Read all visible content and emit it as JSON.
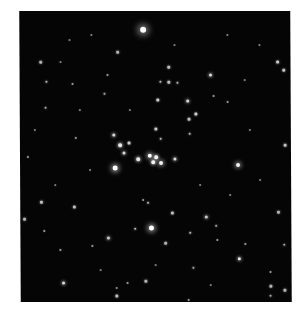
{
  "image": {
    "subject": "Open star cluster in a dense star field",
    "background_color": "#050505",
    "page_background": "#ffffff",
    "frame": {
      "left": 20,
      "top": 11,
      "width": 271,
      "height": 291
    }
  },
  "stars": [
    {
      "x": 144,
      "y": 30,
      "r": 3.2,
      "glow": 7,
      "b": 1.0
    },
    {
      "x": 115,
      "y": 168,
      "r": 2.4,
      "glow": 5,
      "b": 1.0
    },
    {
      "x": 151,
      "y": 228,
      "r": 2.4,
      "glow": 5,
      "b": 1.0
    },
    {
      "x": 238,
      "y": 165,
      "r": 2.0,
      "glow": 4,
      "b": 0.95
    },
    {
      "x": 150,
      "y": 156,
      "r": 2.2,
      "glow": 4,
      "b": 1.0
    },
    {
      "x": 156,
      "y": 157,
      "r": 1.8,
      "glow": 3,
      "b": 0.95
    },
    {
      "x": 153,
      "y": 162,
      "r": 1.8,
      "glow": 3,
      "b": 0.95
    },
    {
      "x": 161,
      "y": 163,
      "r": 2.0,
      "glow": 4,
      "b": 0.95
    },
    {
      "x": 138,
      "y": 159,
      "r": 1.8,
      "glow": 3,
      "b": 0.9
    },
    {
      "x": 175,
      "y": 159,
      "r": 1.6,
      "glow": 3,
      "b": 0.85
    },
    {
      "x": 120,
      "y": 145,
      "r": 1.8,
      "glow": 3,
      "b": 0.9
    },
    {
      "x": 129,
      "y": 143,
      "r": 1.4,
      "glow": 2,
      "b": 0.8
    },
    {
      "x": 124,
      "y": 153,
      "r": 1.5,
      "glow": 3,
      "b": 0.85
    },
    {
      "x": 114,
      "y": 135,
      "r": 1.6,
      "glow": 3,
      "b": 0.85
    },
    {
      "x": 156,
      "y": 129,
      "r": 1.5,
      "glow": 2,
      "b": 0.8
    },
    {
      "x": 161,
      "y": 139,
      "r": 1.2,
      "glow": 2,
      "b": 0.7
    },
    {
      "x": 158,
      "y": 100,
      "r": 1.4,
      "glow": 2,
      "b": 0.8
    },
    {
      "x": 188,
      "y": 101,
      "r": 1.5,
      "glow": 3,
      "b": 0.85
    },
    {
      "x": 196,
      "y": 114,
      "r": 1.4,
      "glow": 2,
      "b": 0.8
    },
    {
      "x": 189,
      "y": 119,
      "r": 1.3,
      "glow": 2,
      "b": 0.75
    },
    {
      "x": 190,
      "y": 134,
      "r": 1.2,
      "glow": 2,
      "b": 0.7
    },
    {
      "x": 211,
      "y": 75,
      "r": 1.6,
      "glow": 3,
      "b": 0.85
    },
    {
      "x": 169,
      "y": 67,
      "r": 1.3,
      "glow": 2,
      "b": 0.75
    },
    {
      "x": 161,
      "y": 82,
      "r": 1.2,
      "glow": 2,
      "b": 0.7
    },
    {
      "x": 169,
      "y": 82,
      "r": 1.3,
      "glow": 2,
      "b": 0.75
    },
    {
      "x": 178,
      "y": 83,
      "r": 1.2,
      "glow": 2,
      "b": 0.7
    },
    {
      "x": 278,
      "y": 62,
      "r": 1.4,
      "glow": 2,
      "b": 0.8
    },
    {
      "x": 284,
      "y": 70,
      "r": 1.3,
      "glow": 2,
      "b": 0.75
    },
    {
      "x": 285,
      "y": 145,
      "r": 1.3,
      "glow": 2,
      "b": 0.75
    },
    {
      "x": 214,
      "y": 96,
      "r": 1.1,
      "glow": 1,
      "b": 0.6
    },
    {
      "x": 228,
      "y": 102,
      "r": 1.1,
      "glow": 1,
      "b": 0.6
    },
    {
      "x": 41,
      "y": 62,
      "r": 1.3,
      "glow": 2,
      "b": 0.7
    },
    {
      "x": 47,
      "y": 82,
      "r": 1.2,
      "glow": 2,
      "b": 0.7
    },
    {
      "x": 73,
      "y": 84,
      "r": 1.1,
      "glow": 1,
      "b": 0.6
    },
    {
      "x": 46,
      "y": 108,
      "r": 1.2,
      "glow": 2,
      "b": 0.65
    },
    {
      "x": 118,
      "y": 52,
      "r": 1.3,
      "glow": 2,
      "b": 0.7
    },
    {
      "x": 108,
      "y": 75,
      "r": 1.1,
      "glow": 1,
      "b": 0.6
    },
    {
      "x": 105,
      "y": 94,
      "r": 1.2,
      "glow": 2,
      "b": 0.65
    },
    {
      "x": 28,
      "y": 157,
      "r": 1.1,
      "glow": 1,
      "b": 0.6
    },
    {
      "x": 76,
      "y": 138,
      "r": 1.1,
      "glow": 1,
      "b": 0.6
    },
    {
      "x": 41,
      "y": 202,
      "r": 1.3,
      "glow": 2,
      "b": 0.75
    },
    {
      "x": 74,
      "y": 207,
      "r": 1.4,
      "glow": 2,
      "b": 0.75
    },
    {
      "x": 24,
      "y": 219,
      "r": 1.3,
      "glow": 2,
      "b": 0.7
    },
    {
      "x": 108,
      "y": 238,
      "r": 1.5,
      "glow": 3,
      "b": 0.8
    },
    {
      "x": 44,
      "y": 231,
      "r": 1.1,
      "glow": 1,
      "b": 0.6
    },
    {
      "x": 63,
      "y": 283,
      "r": 1.6,
      "glow": 3,
      "b": 0.85
    },
    {
      "x": 116,
      "y": 296,
      "r": 1.4,
      "glow": 2,
      "b": 0.75
    },
    {
      "x": 60,
      "y": 250,
      "r": 1.1,
      "glow": 1,
      "b": 0.6
    },
    {
      "x": 92,
      "y": 246,
      "r": 1.1,
      "glow": 1,
      "b": 0.6
    },
    {
      "x": 127,
      "y": 283,
      "r": 1.1,
      "glow": 1,
      "b": 0.6
    },
    {
      "x": 172,
      "y": 213,
      "r": 1.4,
      "glow": 2,
      "b": 0.75
    },
    {
      "x": 206,
      "y": 217,
      "r": 1.5,
      "glow": 3,
      "b": 0.8
    },
    {
      "x": 135,
      "y": 229,
      "r": 1.2,
      "glow": 2,
      "b": 0.7
    },
    {
      "x": 190,
      "y": 233,
      "r": 1.2,
      "glow": 2,
      "b": 0.7
    },
    {
      "x": 148,
      "y": 203,
      "r": 1.2,
      "glow": 2,
      "b": 0.7
    },
    {
      "x": 143,
      "y": 200,
      "r": 1.1,
      "glow": 1,
      "b": 0.6
    },
    {
      "x": 216,
      "y": 226,
      "r": 1.2,
      "glow": 2,
      "b": 0.65
    },
    {
      "x": 239,
      "y": 259,
      "r": 1.7,
      "glow": 3,
      "b": 0.9
    },
    {
      "x": 165,
      "y": 243,
      "r": 1.3,
      "glow": 2,
      "b": 0.7
    },
    {
      "x": 145,
      "y": 281,
      "r": 1.3,
      "glow": 2,
      "b": 0.7
    },
    {
      "x": 193,
      "y": 268,
      "r": 1.2,
      "glow": 2,
      "b": 0.65
    },
    {
      "x": 270,
      "y": 286,
      "r": 1.3,
      "glow": 2,
      "b": 0.7
    },
    {
      "x": 284,
      "y": 290,
      "r": 1.3,
      "glow": 2,
      "b": 0.7
    },
    {
      "x": 270,
      "y": 296,
      "r": 1.2,
      "glow": 2,
      "b": 0.65
    },
    {
      "x": 217,
      "y": 240,
      "r": 1.1,
      "glow": 1,
      "b": 0.6
    },
    {
      "x": 245,
      "y": 244,
      "r": 1.1,
      "glow": 1,
      "b": 0.6
    },
    {
      "x": 270,
      "y": 272,
      "r": 1.1,
      "glow": 1,
      "b": 0.6
    },
    {
      "x": 188,
      "y": 300,
      "r": 1.1,
      "glow": 1,
      "b": 0.6
    },
    {
      "x": 278,
      "y": 212,
      "r": 1.3,
      "glow": 2,
      "b": 0.7
    },
    {
      "x": 284,
      "y": 245,
      "r": 1.2,
      "glow": 2,
      "b": 0.65
    },
    {
      "x": 116,
      "y": 288,
      "r": 1.0,
      "glow": 1,
      "b": 0.55
    },
    {
      "x": 61,
      "y": 62,
      "r": 1.0,
      "glow": 1,
      "b": 0.5
    },
    {
      "x": 92,
      "y": 35,
      "r": 1.0,
      "glow": 1,
      "b": 0.5
    },
    {
      "x": 228,
      "y": 35,
      "r": 1.0,
      "glow": 1,
      "b": 0.5
    },
    {
      "x": 260,
      "y": 45,
      "r": 1.0,
      "glow": 1,
      "b": 0.5
    },
    {
      "x": 250,
      "y": 130,
      "r": 1.0,
      "glow": 1,
      "b": 0.5
    },
    {
      "x": 35,
      "y": 130,
      "r": 1.0,
      "glow": 1,
      "b": 0.5
    },
    {
      "x": 90,
      "y": 170,
      "r": 1.0,
      "glow": 1,
      "b": 0.5
    },
    {
      "x": 200,
      "y": 185,
      "r": 1.0,
      "glow": 1,
      "b": 0.5
    },
    {
      "x": 230,
      "y": 195,
      "r": 1.0,
      "glow": 1,
      "b": 0.5
    },
    {
      "x": 260,
      "y": 180,
      "r": 1.0,
      "glow": 1,
      "b": 0.5
    },
    {
      "x": 80,
      "y": 110,
      "r": 0.9,
      "glow": 1,
      "b": 0.45
    },
    {
      "x": 130,
      "y": 110,
      "r": 0.9,
      "glow": 1,
      "b": 0.45
    },
    {
      "x": 100,
      "y": 270,
      "r": 0.9,
      "glow": 1,
      "b": 0.45
    },
    {
      "x": 210,
      "y": 285,
      "r": 0.9,
      "glow": 1,
      "b": 0.45
    },
    {
      "x": 155,
      "y": 265,
      "r": 0.9,
      "glow": 1,
      "b": 0.45
    },
    {
      "x": 245,
      "y": 80,
      "r": 0.9,
      "glow": 1,
      "b": 0.45
    },
    {
      "x": 55,
      "y": 185,
      "r": 0.9,
      "glow": 1,
      "b": 0.45
    },
    {
      "x": 175,
      "y": 45,
      "r": 0.9,
      "glow": 1,
      "b": 0.45
    },
    {
      "x": 70,
      "y": 40,
      "r": 0.9,
      "glow": 1,
      "b": 0.45
    }
  ]
}
